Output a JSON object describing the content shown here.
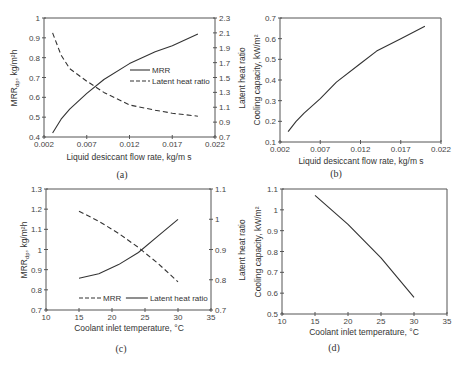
{
  "chart_data": [
    {
      "panel": "(a)",
      "type": "line",
      "xlabel": "Liquid desiccant flow rate, kg/m s",
      "ylabel": "MRR_dp, kg/m²h",
      "ylabel_right": "Latent heat ratio",
      "xlim": [
        0.002,
        0.022
      ],
      "xticks": [
        "0.002",
        "0.007",
        "0.012",
        "0.017",
        "0.022"
      ],
      "ylim": [
        0.4,
        1.0
      ],
      "yticks": [
        "0.4",
        "0.5",
        "0.6",
        "0.7",
        "0.8",
        "0.9",
        "1"
      ],
      "ylim_right": [
        0.7,
        2.3
      ],
      "yticks_right": [
        "0.7",
        "0.9",
        "1.1",
        "1.3",
        "1.5",
        "1.7",
        "1.9",
        "2.1",
        "2.3"
      ],
      "grid": false,
      "legend_position": "center-right",
      "series": [
        {
          "name": "MRR",
          "axis": "left",
          "style": "solid",
          "x": [
            0.003,
            0.004,
            0.005,
            0.007,
            0.009,
            0.012,
            0.015,
            0.017,
            0.02
          ],
          "values": [
            0.42,
            0.49,
            0.54,
            0.62,
            0.69,
            0.77,
            0.83,
            0.86,
            0.92
          ]
        },
        {
          "name": "Latent heat ratio",
          "axis": "right",
          "style": "dashed",
          "x": [
            0.003,
            0.004,
            0.005,
            0.007,
            0.009,
            0.012,
            0.015,
            0.017,
            0.02
          ],
          "values": [
            2.1,
            1.8,
            1.62,
            1.45,
            1.3,
            1.13,
            1.06,
            1.02,
            0.98
          ]
        }
      ]
    },
    {
      "panel": "(b)",
      "type": "line",
      "xlabel": "Liquid desiccant flow rate, kg/m s",
      "ylabel": "Cooling capacity, kW/m²",
      "xlim": [
        0.002,
        0.022
      ],
      "xticks": [
        "0.002",
        "0.007",
        "0.012",
        "0.017",
        "0.022"
      ],
      "ylim": [
        0.1,
        0.7
      ],
      "yticks": [
        "0.1",
        "0.2",
        "0.3",
        "0.4",
        "0.5",
        "0.6",
        "0.7"
      ],
      "grid": false,
      "series": [
        {
          "name": "Cooling capacity",
          "style": "solid",
          "x": [
            0.003,
            0.004,
            0.005,
            0.007,
            0.009,
            0.012,
            0.014,
            0.017,
            0.02
          ],
          "values": [
            0.15,
            0.2,
            0.24,
            0.31,
            0.39,
            0.48,
            0.54,
            0.6,
            0.66
          ]
        }
      ]
    },
    {
      "panel": "(c)",
      "type": "line",
      "xlabel": "Coolant inlet temperature, °C",
      "ylabel": "MRR_dp, kg/m²h",
      "ylabel_right": "Latent heat ratio",
      "xlim": [
        10,
        35
      ],
      "xticks": [
        "10",
        "15",
        "20",
        "25",
        "30",
        "35"
      ],
      "ylim": [
        0.7,
        1.3
      ],
      "yticks": [
        "0.7",
        "0.8",
        "0.9",
        "1",
        "1.1",
        "1.2",
        "1.3"
      ],
      "ylim_right": [
        0.7,
        1.1
      ],
      "yticks_right": [
        "0.7",
        "0.8",
        "0.9",
        "1",
        "1.1"
      ],
      "grid": false,
      "legend_position": "bottom",
      "series": [
        {
          "name": "MRR",
          "axis": "left",
          "style": "dashed",
          "x": [
            15,
            18,
            21,
            24,
            27,
            30
          ],
          "values": [
            1.19,
            1.14,
            1.08,
            1.01,
            0.93,
            0.84
          ]
        },
        {
          "name": "Latent heat ratio",
          "axis": "right",
          "style": "solid",
          "x": [
            15,
            18,
            21,
            24,
            27,
            30
          ],
          "values": [
            0.805,
            0.82,
            0.85,
            0.89,
            0.945,
            1.0
          ]
        }
      ]
    },
    {
      "panel": "(d)",
      "type": "line",
      "xlabel": "Coolant inlet temperature, °C",
      "ylabel": "Cooling capacity, kW/m²",
      "xlim": [
        10,
        35
      ],
      "xticks": [
        "10",
        "15",
        "20",
        "25",
        "30",
        "35"
      ],
      "ylim": [
        0.5,
        1.1
      ],
      "yticks": [
        "0.5",
        "0.6",
        "0.7",
        "0.8",
        "0.9",
        "1",
        "1.1"
      ],
      "grid": false,
      "series": [
        {
          "name": "Cooling capacity",
          "style": "solid",
          "x": [
            15,
            20,
            25,
            30
          ],
          "values": [
            1.07,
            0.93,
            0.77,
            0.58
          ]
        }
      ]
    }
  ],
  "labels": {
    "a": {
      "panel": "(a)",
      "xlabel": "Liquid desiccant flow rate, kg/m s",
      "ylabel_main": "MRR",
      "ylabel_sub": "dp",
      "ylabel_tail": ", kg/m²h",
      "ylabel_right": "Latent heat ratio",
      "legend": [
        "MRR",
        "Latent heat ratio"
      ]
    },
    "b": {
      "panel": "(b)",
      "xlabel": "Liquid desiccant flow rate, kg/m s",
      "ylabel": "Cooling capacity, kW/m²"
    },
    "c": {
      "panel": "(c)",
      "xlabel": "Coolant inlet temperature, °C",
      "ylabel_main": "MRR",
      "ylabel_sub": "dp",
      "ylabel_tail": ", kg/m²h",
      "ylabel_right": "Latent heat ratio",
      "legend": [
        "MRR",
        "Latent heat ratio"
      ]
    },
    "d": {
      "panel": "(d)",
      "xlabel": "Coolant inlet temperature, °C",
      "ylabel": "Cooling capacity, kW/m²"
    }
  },
  "colors": {
    "line": "#333333",
    "axis": "#555555",
    "background": "#ffffff"
  }
}
